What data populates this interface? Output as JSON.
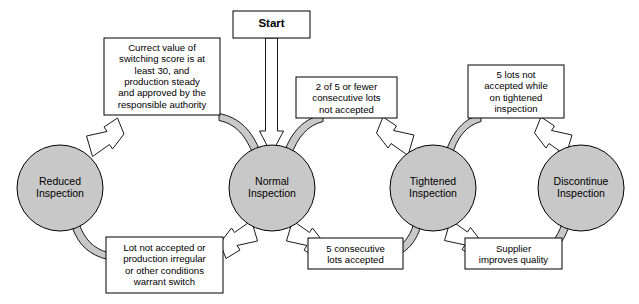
{
  "diagram": {
    "type": "state-transition-diagram",
    "colors": {
      "node_fill": "#c8c8c8",
      "node_stroke": "#000000",
      "arrow_gray_fill": "#c8c8c8",
      "arrow_white_fill": "#ffffff",
      "stroke": "#000000",
      "background": "#ffffff",
      "text": "#000000"
    },
    "start": {
      "label": "Start",
      "target": "Normal Inspection"
    },
    "nodes": [
      {
        "id": "reduced",
        "label": "Reduced\nInspection",
        "cx": 60,
        "cy": 188,
        "r": 43
      },
      {
        "id": "normal",
        "label": "Normal\nInspection",
        "cx": 272,
        "cy": 188,
        "r": 43
      },
      {
        "id": "tightened",
        "label": "Tightened\nInspection",
        "cx": 433,
        "cy": 188,
        "r": 43
      },
      {
        "id": "discontinue",
        "label": "Discontinue\nInspection",
        "cx": 581,
        "cy": 188,
        "r": 43
      }
    ],
    "transitions": [
      {
        "id": "normal-to-reduced",
        "from": "Normal Inspection",
        "to": "Reduced Inspection",
        "position": "top",
        "arrow_style": "white",
        "label": "Currect value of\nswitching score is at\nleast 30, and\nproduction steady\nand approved by the\nresponsible authority"
      },
      {
        "id": "reduced-to-normal",
        "from": "Reduced Inspection",
        "to": "Normal Inspection",
        "position": "bottom",
        "arrow_style": "white",
        "label": "Lot not accepted or\nproduction irregular\nor other conditions\nwarrant switch"
      },
      {
        "id": "normal-to-tightened",
        "from": "Normal Inspection",
        "to": "Tightened Inspection",
        "position": "top",
        "arrow_style": "white",
        "label": "2 of 5 or fewer\nconsecutive lots\nnot accepted"
      },
      {
        "id": "tightened-to-normal",
        "from": "Tightened Inspection",
        "to": "Normal Inspection",
        "position": "bottom",
        "arrow_style": "white",
        "label": "5 consecutive\nlots accepted"
      },
      {
        "id": "tightened-to-discontinue",
        "from": "Tightened Inspection",
        "to": "Discontinue Inspection",
        "position": "top",
        "arrow_style": "white",
        "label": "5 lots not\naccepted while\non tightened\ninspection"
      },
      {
        "id": "discontinue-to-tightened",
        "from": "Discontinue Inspection",
        "to": "Tightened Inspection",
        "position": "bottom",
        "arrow_style": "white",
        "label": "Supplier\nimproves quality"
      }
    ]
  }
}
